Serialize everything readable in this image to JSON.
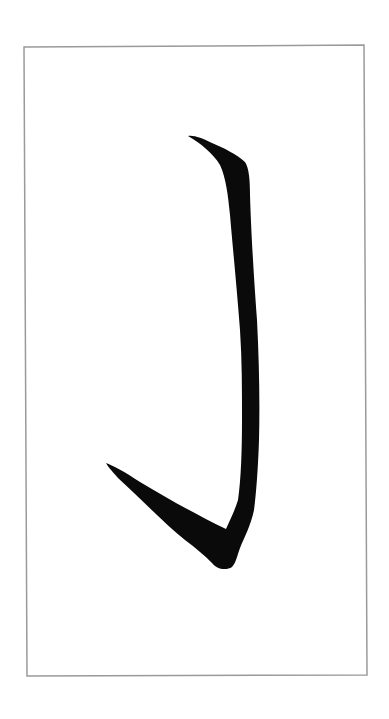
{
  "image": {
    "description": "Calligraphy brush stroke (vertical hook stroke) inside a thin gray rectangular frame on white background",
    "background_color": "#ffffff",
    "frame": {
      "stroke_color": "#9a9a9a",
      "stroke_width": 1.5,
      "corners": [
        [
          24,
          47
        ],
        [
          364,
          45
        ],
        [
          367,
          675
        ],
        [
          27,
          676
        ]
      ]
    },
    "brush_stroke": {
      "name": "vertical-hook-stroke",
      "ink_color": "#0a0a0a"
    }
  }
}
